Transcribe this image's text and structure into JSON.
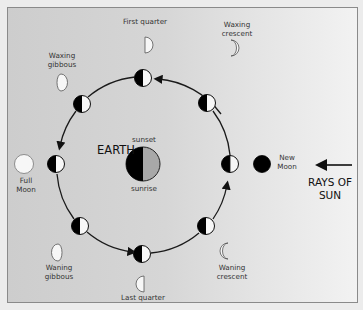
{
  "diagram": {
    "earth": {
      "label": "EARTH",
      "top_label": "sunset",
      "bottom_label": "sunrise",
      "dark_color": "#000000",
      "lit_color": "#a8a8a8"
    },
    "sun": {
      "label_line1": "RAYS OF",
      "label_line2": "SUN",
      "direction": "right-to-left"
    },
    "orbit_direction": "counter-clockwise",
    "phases": [
      {
        "name": "New Moon",
        "line1": "New",
        "line2": "Moon"
      },
      {
        "name": "Waxing crescent",
        "line1": "Waxing",
        "line2": "crescent"
      },
      {
        "name": "First quarter",
        "line1": "First quarter",
        "line2": ""
      },
      {
        "name": "Waxing gibbous",
        "line1": "Waxing",
        "line2": "gibbous"
      },
      {
        "name": "Full Moon",
        "line1": "Full",
        "line2": "Moon"
      },
      {
        "name": "Waning gibbous",
        "line1": "Waning",
        "line2": "gibbous"
      },
      {
        "name": "Last quarter",
        "line1": "Last quarter",
        "line2": ""
      },
      {
        "name": "Waning crescent",
        "line1": "Waning",
        "line2": "crescent"
      }
    ],
    "colors": {
      "line": "#1a1a1a",
      "moon_lit": "#f7f7f7",
      "moon_dark": "#000000"
    }
  }
}
